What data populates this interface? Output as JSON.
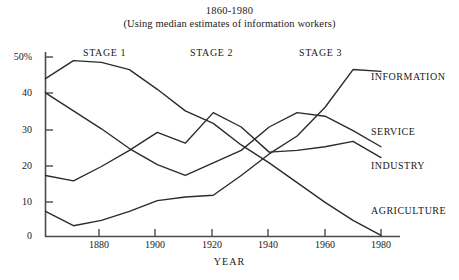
{
  "chart_data": {
    "type": "line",
    "title": "1860-1980",
    "subtitle": "(Using median estimates of information workers)",
    "xlabel": "YEAR",
    "ylabel": "",
    "xlim": [
      1860,
      1985
    ],
    "ylim": [
      0,
      52
    ],
    "grid": false,
    "legend_position": "right-inline",
    "xticks": [
      1880,
      1900,
      1920,
      1940,
      1960,
      1980
    ],
    "xtick_labels": [
      "1880",
      "1900",
      "1920",
      "1940",
      "1960",
      "1980"
    ],
    "yticks": [
      0,
      10,
      20,
      30,
      40,
      50
    ],
    "ytick_labels": [
      "0",
      "10",
      "20",
      "30",
      "40",
      "50%"
    ],
    "annotations": [
      {
        "text": "STAGE 1",
        "x": 1880
      },
      {
        "text": "STAGE 2",
        "x": 1920
      },
      {
        "text": "STAGE 3",
        "x": 1958
      }
    ],
    "series": [
      {
        "name": "AGRICULTURE",
        "label": "AGRICULTURE",
        "color": "#2b2b2b",
        "x": [
          1860,
          1870,
          1880,
          1890,
          1900,
          1910,
          1920,
          1930,
          1940,
          1950,
          1960,
          1970,
          1980
        ],
        "values": [
          44.0,
          49.0,
          48.5,
          46.5,
          41.0,
          35.0,
          31.5,
          25.5,
          20.5,
          15.0,
          9.5,
          4.5,
          0.3
        ]
      },
      {
        "name": "SERVICE",
        "label": "SERVICE",
        "color": "#2b2b2b",
        "x": [
          1860,
          1870,
          1880,
          1890,
          1900,
          1910,
          1920,
          1930,
          1940,
          1950,
          1960,
          1970,
          1980
        ],
        "values": [
          40.0,
          35.0,
          30.0,
          24.5,
          20.0,
          17.0,
          20.5,
          24.0,
          30.5,
          34.5,
          33.5,
          29.5,
          25.0
        ]
      },
      {
        "name": "INDUSTRY",
        "label": "INDUSTRY",
        "color": "#2b2b2b",
        "x": [
          1860,
          1870,
          1880,
          1890,
          1900,
          1910,
          1920,
          1930,
          1940,
          1950,
          1960,
          1970,
          1980
        ],
        "values": [
          17.0,
          15.5,
          19.5,
          24.0,
          29.0,
          26.0,
          34.5,
          30.5,
          23.5,
          24.0,
          25.0,
          26.5,
          22.0
        ]
      },
      {
        "name": "INFORMATION",
        "label": "INFORMATION",
        "color": "#2b2b2b",
        "x": [
          1860,
          1870,
          1880,
          1890,
          1900,
          1910,
          1920,
          1930,
          1940,
          1950,
          1960,
          1970,
          1980
        ],
        "values": [
          7.0,
          3.0,
          4.5,
          7.0,
          10.0,
          11.0,
          11.5,
          17.0,
          23.0,
          28.0,
          36.0,
          46.5,
          46.0
        ]
      }
    ]
  },
  "labels": {
    "information": "INFORMATION",
    "service": "SERVICE",
    "industry": "INDUSTRY",
    "agriculture": "AGRICULTURE"
  }
}
